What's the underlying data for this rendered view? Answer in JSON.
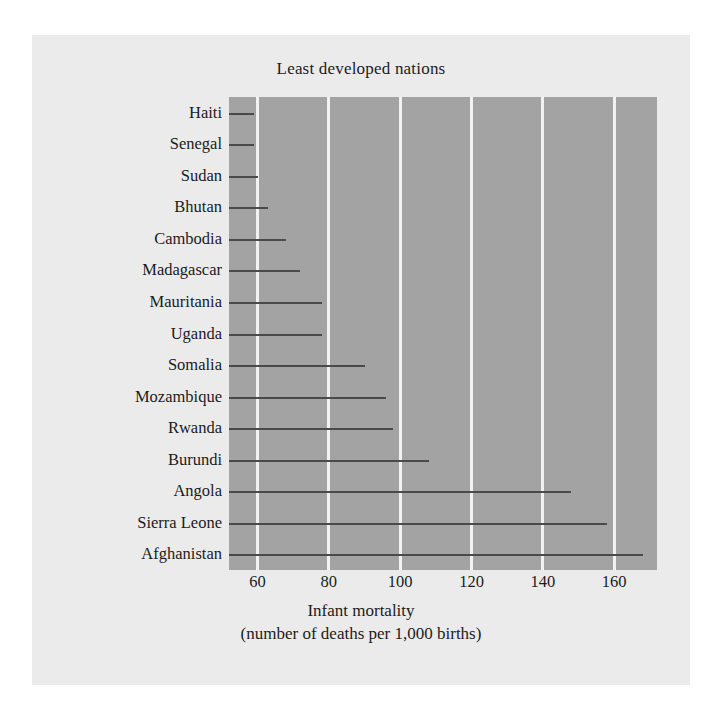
{
  "chart_data": {
    "type": "bar",
    "title": "Least developed nations",
    "xlabel_line1": "Infant mortality",
    "xlabel_line2": "(number of deaths per 1,000 births)",
    "ylabel": "",
    "xlim": [
      52,
      172
    ],
    "xticks": [
      60,
      80,
      100,
      120,
      140,
      160
    ],
    "xtick_labels": [
      "60",
      "80",
      "100",
      "120",
      "140",
      "160"
    ],
    "grid": true,
    "legend": "none",
    "orientation": "horizontal",
    "categories": [
      "Haiti",
      "Senegal",
      "Sudan",
      "Bhutan",
      "Cambodia",
      "Madagascar",
      "Mauritania",
      "Uganda",
      "Somalia",
      "Mozambique",
      "Rwanda",
      "Burundi",
      "Angola",
      "Sierra Leone",
      "Afghanistan"
    ],
    "values": [
      59,
      59,
      60,
      63,
      68,
      72,
      78,
      78,
      90,
      96,
      98,
      108,
      148,
      158,
      168
    ],
    "colors": {
      "plot_background": "#a3a3a3",
      "card_background": "#ebebeb",
      "page_background": "#ffffff",
      "gridline": "#f2f2f2",
      "bar_line": "#4a4a4a",
      "text": "#1b1b1b"
    }
  }
}
